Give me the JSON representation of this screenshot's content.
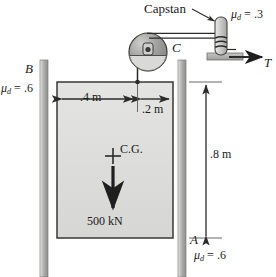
{
  "figure": {
    "type": "engineering-mechanics-free-body-diagram"
  },
  "labels": {
    "capstan": "Capstan",
    "point_c": "C",
    "point_b": "B",
    "point_a": "A",
    "tension": "T",
    "cg": "C.G.",
    "weight": "500 kN",
    "mu_symbol": "μ",
    "mu_subscript": "d",
    "mu_capstan_value": "= .3",
    "mu_left_rail_value": "= .6",
    "mu_bottom_value": "= .6",
    "dim_left": ".4 m",
    "dim_right": ".2 m",
    "dim_height": ".8 m"
  },
  "values": {
    "mu_capstan": ".3",
    "mu_rail_b": ".6",
    "mu_rail_a": ".6",
    "width_left_of_rope": ".4 m",
    "width_right_of_rope": ".2 m",
    "travel_height": ".8 m",
    "block_weight": "500 kN"
  },
  "colors": {
    "background": "#ffffff",
    "block_fill": "#dededc",
    "rail_fill": "#b8b8b6",
    "pulley_fill": "#9a9a98",
    "outline": "#2b2b2b",
    "text": "#1a1a1a"
  },
  "icons": {
    "pulley": "pulley-icon",
    "capstan_post": "capstan-post-icon",
    "weight_arrow": "down-arrow-icon",
    "tension_arrow": "right-arrow-icon",
    "cg_marker": "plus-marker-icon"
  }
}
